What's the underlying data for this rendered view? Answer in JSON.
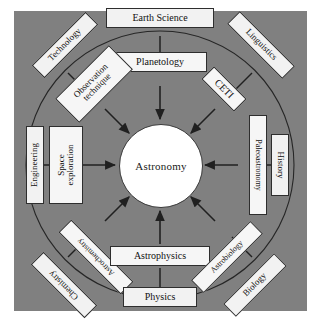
{
  "diagram": {
    "type": "radial-hub-and-spoke",
    "center": {
      "label": "Astronomy",
      "shape": "circle",
      "fill": "#ffffff"
    },
    "panel": {
      "background": "#808080",
      "border": "none"
    },
    "ring": {
      "stroke": "#2a2a2a",
      "style": "thin-circle"
    },
    "arrow_direction": "inward",
    "spokes": [
      {
        "id": "north",
        "angle_deg": 270,
        "outer": "Earth Science",
        "inner": "Planetology"
      },
      {
        "id": "northwest",
        "angle_deg": 225,
        "outer": "Technology",
        "inner": "Observation\ntechnique"
      },
      {
        "id": "west",
        "angle_deg": 180,
        "outer": "Engineering",
        "inner": "Space\nexploration"
      },
      {
        "id": "southwest",
        "angle_deg": 135,
        "outer": "Chemistry",
        "inner": "Astrochemistry"
      },
      {
        "id": "south",
        "angle_deg": 90,
        "outer": "Physics",
        "inner": "Astrophysics"
      },
      {
        "id": "southeast",
        "angle_deg": 45,
        "outer": "Biology",
        "inner": "Astrobiology"
      },
      {
        "id": "east",
        "angle_deg": 0,
        "outer": "History",
        "inner": "Paleoastronomy"
      },
      {
        "id": "northeast",
        "angle_deg": 315,
        "outer": "Linguistics",
        "inner": "CETI"
      }
    ]
  },
  "nodes": {
    "earth_science": "Earth Science",
    "planetology": "Planetology",
    "technology": "Technology",
    "observation_technique": "Observation\ntechnique",
    "engineering": "Engineering",
    "space_exploration": "Space\nexploration",
    "chemistry": "Chemistry",
    "astrochemistry": "Astrochemistry",
    "physics": "Physics",
    "astrophysics": "Astrophysics",
    "biology": "Biology",
    "astrobiology": "Astrobiology",
    "history": "History",
    "paleoastronomy": "Paleoastronomy",
    "linguistics": "Linguistics",
    "ceti": "CETI",
    "astronomy": "Astronomy"
  }
}
